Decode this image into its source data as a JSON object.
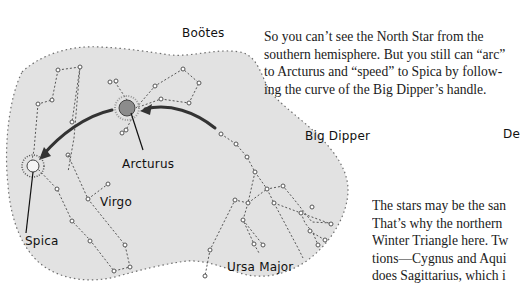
{
  "labels": {
    "bootes": "Boötes",
    "big_dipper": "Big Dipper",
    "arcturus": "Arcturus",
    "virgo": "Virgo",
    "spica": "Spica",
    "ursa_major": "Ursa Major",
    "cut_off_label": "De"
  },
  "paragraph_top": {
    "lines": [
      "So you can’t see the North Star from the",
      "southern hemisphere. But you still can “arc”",
      "to Arcturus and “speed” to Spica by follow-",
      "ing the curve of the Big Dipper’s handle."
    ]
  },
  "paragraph_bottom": {
    "lines": [
      "The stars may be the san",
      "That’s why the northern",
      "Winter Triangle here. Tw",
      "tions—Cygnus and Aqui",
      "does Sagittarius, which i"
    ]
  },
  "colors": {
    "map_fill": "#e2e2e2",
    "arcturus_fill": "#8c8c8c",
    "arrow": "#333333"
  }
}
